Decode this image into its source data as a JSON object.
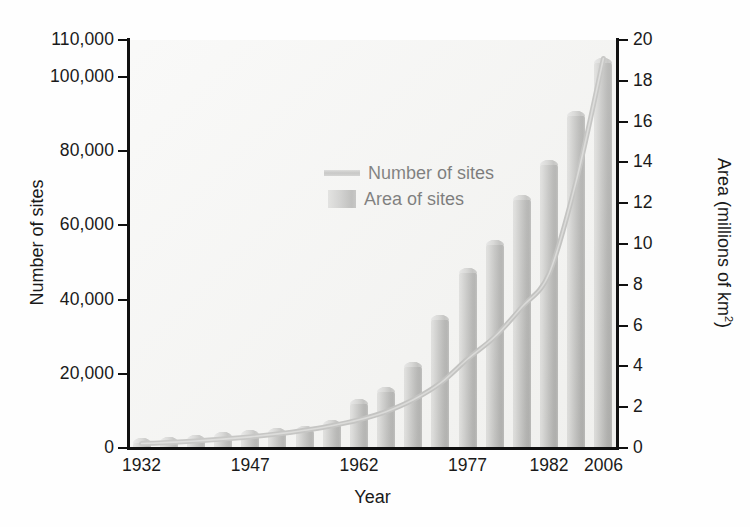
{
  "chart_data": {
    "type": "bar",
    "title": "",
    "subtitle": "",
    "xlabel": "Year",
    "ylabel": "Number of sites",
    "y2label": "Area (millions of km²)",
    "ylim": [
      0,
      110000
    ],
    "y2lim": [
      0,
      20
    ],
    "grid": false,
    "legend_position": "upper-left-inside",
    "x_tick_labels": [
      "1932",
      "1947",
      "1962",
      "1977",
      "1982",
      "2006"
    ],
    "x_tick_positions": [
      0,
      4,
      8,
      12,
      15,
      17
    ],
    "y_tick_labels": [
      "0",
      "20,000",
      "40,000",
      "60,000",
      "80,000",
      "100,000",
      "110,000"
    ],
    "y_tick_values": [
      0,
      20000,
      40000,
      60000,
      80000,
      100000,
      110000
    ],
    "y2_tick_labels": [
      "0",
      "2",
      "4",
      "6",
      "8",
      "10",
      "12",
      "14",
      "16",
      "18",
      "20"
    ],
    "y2_tick_values": [
      0,
      2,
      4,
      6,
      8,
      10,
      12,
      14,
      16,
      18,
      20
    ],
    "categories": [
      "1932",
      "1936",
      "1940",
      "1944",
      "1947",
      "1951",
      "1955",
      "1959",
      "1962",
      "1966",
      "1970",
      "1974",
      "1977",
      "1979",
      "1981",
      "1982",
      "1995",
      "2006"
    ],
    "series": [
      {
        "name": "Area of sites",
        "type": "bar",
        "axis": "right",
        "unit": "millions of km²",
        "values": [
          0.5,
          0.55,
          0.65,
          0.8,
          0.9,
          1.0,
          1.1,
          1.35,
          2.4,
          3.0,
          4.2,
          6.5,
          8.8,
          10.2,
          12.4,
          14.1,
          16.5,
          19.1
        ]
      },
      {
        "name": "Number of sites",
        "type": "line",
        "axis": "left",
        "unit": "sites",
        "values": [
          1200,
          1500,
          1900,
          2400,
          3000,
          3800,
          4800,
          6000,
          7600,
          9800,
          13000,
          17500,
          24000,
          30000,
          38000,
          47000,
          72000,
          105000
        ]
      }
    ]
  },
  "legend": {
    "items": [
      {
        "label": "Number of sites",
        "marker": "line"
      },
      {
        "label": "Area of sites",
        "marker": "bar"
      }
    ]
  },
  "axis_titles": {
    "left": "Number of sites",
    "right_prefix": "Area (millions of km",
    "right_sup": "2",
    "right_suffix": ")",
    "bottom": "Year"
  }
}
